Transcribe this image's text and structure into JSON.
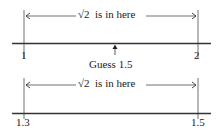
{
  "diagram1": {
    "range_text_prefix": "√2",
    "range_text_suffix": "is in here",
    "left_label": "1",
    "right_label": "2",
    "guess_label": "Guess 1.5"
  },
  "diagram2": {
    "range_text_prefix": "√2",
    "range_text_suffix": "is in here",
    "left_label": "1.3",
    "right_label": "1.5"
  },
  "colors": {
    "line": "#222222",
    "background": "#ffffff"
  }
}
